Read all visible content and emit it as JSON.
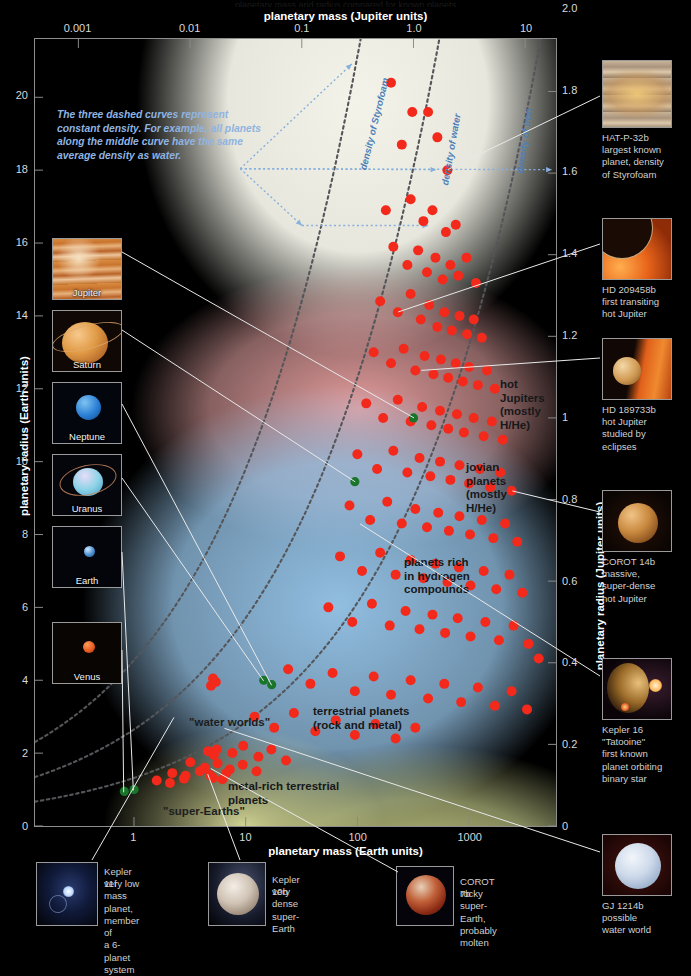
{
  "chart_data": {
    "type": "scatter",
    "title": "",
    "xlabel_top": "planetary mass (Jupiter units)",
    "xlabel_bottom": "planetary mass (Earth units)",
    "ylabel_left": "planetary radius (Earth units)",
    "ylabel_right": "planetary radius (Jupiter units)",
    "x_top_ticks": [
      "0.001",
      "0.01",
      "0.1",
      "1.0",
      "10"
    ],
    "x_bottom_ticks": [
      "1",
      "10",
      "100",
      "1000"
    ],
    "y_left_ticks": [
      "0",
      "2",
      "4",
      "6",
      "8",
      "10",
      "12",
      "14",
      "16",
      "18",
      "20"
    ],
    "y_right_ticks": [
      "0",
      "0.2",
      "0.4",
      "0.6",
      "0.8",
      "1",
      "1.2",
      "1.4",
      "1.6",
      "1.8",
      "2.0"
    ],
    "xscale": "log",
    "xlim_earth": [
      0.13,
      6000
    ],
    "ylim_earth": [
      0,
      21.6
    ],
    "grid": false,
    "legend": "none",
    "series": [
      {
        "name": "exoplanets",
        "color": "#f3291c",
        "marker": "circle",
        "points": [
          [
            200,
            20.4
          ],
          [
            310,
            19.6
          ],
          [
            430,
            19.6
          ],
          [
            250,
            18.7
          ],
          [
            640,
            18.0
          ],
          [
            520,
            18.9
          ],
          [
            180,
            16.9
          ],
          [
            300,
            17.2
          ],
          [
            390,
            16.6
          ],
          [
            470,
            16.9
          ],
          [
            620,
            16.3
          ],
          [
            760,
            16.5
          ],
          [
            210,
            15.9
          ],
          [
            280,
            15.4
          ],
          [
            350,
            15.8
          ],
          [
            420,
            15.2
          ],
          [
            500,
            15.6
          ],
          [
            580,
            15.0
          ],
          [
            680,
            15.4
          ],
          [
            800,
            15.1
          ],
          [
            950,
            15.6
          ],
          [
            1150,
            14.9
          ],
          [
            160,
            14.4
          ],
          [
            230,
            14.1
          ],
          [
            300,
            14.6
          ],
          [
            370,
            13.9
          ],
          [
            440,
            14.3
          ],
          [
            520,
            13.7
          ],
          [
            600,
            14.1
          ],
          [
            700,
            13.6
          ],
          [
            820,
            14.0
          ],
          [
            960,
            13.5
          ],
          [
            1100,
            13.9
          ],
          [
            1300,
            13.4
          ],
          [
            140,
            13.0
          ],
          [
            200,
            12.7
          ],
          [
            260,
            13.1
          ],
          [
            330,
            12.5
          ],
          [
            400,
            12.9
          ],
          [
            480,
            12.4
          ],
          [
            560,
            12.8
          ],
          [
            650,
            12.3
          ],
          [
            760,
            12.7
          ],
          [
            880,
            12.2
          ],
          [
            1000,
            12.6
          ],
          [
            1200,
            12.1
          ],
          [
            1450,
            12.5
          ],
          [
            1700,
            12.0
          ],
          [
            120,
            11.6
          ],
          [
            170,
            11.2
          ],
          [
            230,
            11.7
          ],
          [
            300,
            11.1
          ],
          [
            380,
            11.5
          ],
          [
            460,
            11.0
          ],
          [
            550,
            11.4
          ],
          [
            650,
            10.9
          ],
          [
            780,
            11.3
          ],
          [
            900,
            10.8
          ],
          [
            1100,
            11.2
          ],
          [
            1350,
            10.7
          ],
          [
            1600,
            11.1
          ],
          [
            2000,
            10.6
          ],
          [
            100,
            10.2
          ],
          [
            150,
            9.8
          ],
          [
            210,
            10.3
          ],
          [
            280,
            9.7
          ],
          [
            360,
            10.1
          ],
          [
            450,
            9.6
          ],
          [
            550,
            10.0
          ],
          [
            680,
            9.5
          ],
          [
            820,
            9.9
          ],
          [
            1000,
            9.4
          ],
          [
            1250,
            9.8
          ],
          [
            1550,
            9.3
          ],
          [
            1900,
            9.7
          ],
          [
            2400,
            9.2
          ],
          [
            85,
            8.8
          ],
          [
            130,
            8.4
          ],
          [
            185,
            8.9
          ],
          [
            250,
            8.3
          ],
          [
            330,
            8.7
          ],
          [
            420,
            8.2
          ],
          [
            530,
            8.6
          ],
          [
            660,
            8.1
          ],
          [
            820,
            8.5
          ],
          [
            1020,
            8.0
          ],
          [
            1300,
            8.4
          ],
          [
            1650,
            7.9
          ],
          [
            2100,
            8.3
          ],
          [
            2700,
            7.8
          ],
          [
            70,
            7.4
          ],
          [
            110,
            7.0
          ],
          [
            160,
            7.5
          ],
          [
            220,
            6.9
          ],
          [
            300,
            7.3
          ],
          [
            390,
            6.8
          ],
          [
            500,
            7.2
          ],
          [
            640,
            6.7
          ],
          [
            810,
            7.1
          ],
          [
            1030,
            6.6
          ],
          [
            1350,
            7.0
          ],
          [
            1750,
            6.5
          ],
          [
            2300,
            6.9
          ],
          [
            3000,
            6.4
          ],
          [
            55,
            6.0
          ],
          [
            90,
            5.6
          ],
          [
            135,
            6.1
          ],
          [
            195,
            5.5
          ],
          [
            270,
            5.9
          ],
          [
            360,
            5.4
          ],
          [
            470,
            5.8
          ],
          [
            610,
            5.3
          ],
          [
            790,
            5.7
          ],
          [
            1030,
            5.2
          ],
          [
            1400,
            5.6
          ],
          [
            1850,
            5.1
          ],
          [
            2500,
            5.5
          ],
          [
            3400,
            5.0
          ],
          [
            24,
            4.3
          ],
          [
            38,
            3.9
          ],
          [
            60,
            4.2
          ],
          [
            95,
            3.7
          ],
          [
            140,
            4.1
          ],
          [
            200,
            3.6
          ],
          [
            300,
            4.0
          ],
          [
            430,
            3.5
          ],
          [
            600,
            3.9
          ],
          [
            850,
            3.4
          ],
          [
            1200,
            3.8
          ],
          [
            1700,
            3.3
          ],
          [
            2400,
            3.7
          ],
          [
            3300,
            3.2
          ],
          [
            4200,
            4.6
          ],
          [
            12,
            3.0
          ],
          [
            18,
            2.7
          ],
          [
            27,
            3.1
          ],
          [
            42,
            2.6
          ],
          [
            64,
            2.9
          ],
          [
            95,
            2.5
          ],
          [
            145,
            2.8
          ],
          [
            220,
            2.4
          ],
          [
            330,
            2.7
          ],
          [
            5.5,
            2.1
          ],
          [
            7.6,
            2.0
          ],
          [
            9.5,
            2.2
          ],
          [
            13,
            1.9
          ],
          [
            17,
            2.1
          ],
          [
            23,
            1.8
          ],
          [
            3.2,
            1.75
          ],
          [
            4.3,
            1.6
          ],
          [
            5.6,
            1.72
          ],
          [
            7.2,
            1.55
          ],
          [
            9.4,
            1.68
          ],
          [
            12.5,
            1.5
          ],
          [
            2.2,
            1.45
          ],
          [
            2.9,
            1.38
          ],
          [
            3.9,
            1.5
          ],
          [
            5.1,
            1.32
          ],
          [
            6.7,
            1.45
          ],
          [
            1.6,
            1.25
          ],
          [
            2.1,
            1.18
          ],
          [
            2.8,
            1.3
          ],
          [
            4.8,
            1.4
          ],
          [
            6.2,
            1.28
          ],
          [
            4.6,
            2.05
          ],
          [
            5.2,
            1.95
          ],
          [
            4.9,
            3.85
          ],
          [
            5.4,
            3.95
          ],
          [
            5.1,
            4.05
          ]
        ]
      },
      {
        "name": "solar system planets",
        "color": "#19752a",
        "marker": "circle",
        "points": [
          [
            318,
            11.2
          ],
          [
            95,
            9.45
          ],
          [
            17.1,
            3.88
          ],
          [
            14.5,
            4.0
          ],
          [
            1.0,
            1.0
          ],
          [
            0.82,
            0.95
          ]
        ]
      }
    ],
    "density_curves": [
      {
        "label": "density of Styrofoam",
        "style": "dashed",
        "color": "#55565a"
      },
      {
        "label": "density of water",
        "style": "dashed",
        "color": "#55565a"
      },
      {
        "label": "density of iron",
        "style": "dashed",
        "color": "#55565a"
      }
    ],
    "region_labels": [
      "hot\nJupiters\n(mostly\nH/He)",
      "jovian\nplanets\n(mostly\nH/He)",
      "planets rich\nin hydrogen\ncompounds",
      "terrestrial planets\n(rock and metal)",
      "\"water worlds\"",
      "metal-rich terrestrial\nplanets",
      "\"super-Earths\""
    ],
    "annotation": "The three dashed curves represent constant density. For example, all planets along the middle curve have the same average density as water."
  },
  "axes": {
    "x_top_title": "planetary mass (Jupiter units)",
    "x_bottom_title": "planetary mass (Earth units)",
    "y_left_title": "planetary radius (Earth units)",
    "y_right_title": "planetary radius (Jupiter units)"
  },
  "top_cut_text": "planetary mass and radius compared for known planets",
  "annotation": "The three dashed curves represent constant density. For example, all planets along the middle curve have the same average density as water.",
  "density_labels": {
    "styrofoam": "density of Styrofoam",
    "water": "density of water",
    "iron": "density of iron"
  },
  "regions": {
    "hot_jupiters": "hot\nJupiters\n(mostly\nH/He)",
    "jovian": "jovian\nplanets\n(mostly\nH/He)",
    "hydrogen": "planets rich\nin hydrogen\ncompounds",
    "terrestrial": "terrestrial planets\n(rock and metal)",
    "water_worlds": "\"water worlds\"",
    "metal_rich": "metal-rich terrestrial\nplanets",
    "super_earths": "\"super-Earths\""
  },
  "solar_system": [
    {
      "name": "Jupiter"
    },
    {
      "name": "Saturn"
    },
    {
      "name": "Neptune"
    },
    {
      "name": "Uranus"
    },
    {
      "name": "Earth"
    },
    {
      "name": "Venus"
    }
  ],
  "right_callouts": [
    {
      "title": "HAT-P-32b",
      "desc": "largest known\nplanet, density\nof Styrofoam"
    },
    {
      "title": "HD 209458b",
      "desc": "first transiting\nhot Jupiter"
    },
    {
      "title": "HD 189733b",
      "desc": "hot Jupiter\nstudied by\neclipses"
    },
    {
      "title": "COROT 14b",
      "desc": "massive,\nsuper-dense\nhot Jupiter"
    },
    {
      "title": "Kepler 16",
      "desc": "\"Tatooine\"\nfirst known\nplanet orbiting\nbinary star"
    },
    {
      "title": "GJ 1214b",
      "desc": "possible\nwater world"
    }
  ],
  "bottom_callouts": [
    {
      "title": "Kepler 11f",
      "desc": "very low mass\nplanet, member of\na 6-planet system"
    },
    {
      "title": "Kepler 10b",
      "desc": "very dense\nsuper-Earth"
    },
    {
      "title": "COROT 7b",
      "desc": "rocky super-Earth,\nprobably molten"
    }
  ],
  "colors": {
    "exoplanet_dot": "#f3291c",
    "solar_dot": "#19752a",
    "density_curve": "#55565a",
    "annotation_text": "#8fb4e0",
    "leader_line": "#e9e9e9"
  }
}
